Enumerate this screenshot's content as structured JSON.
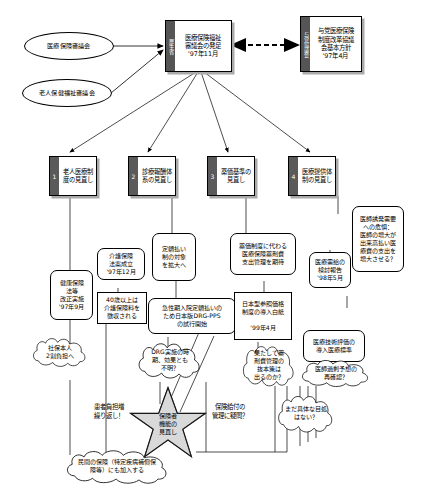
{
  "diagram": {
    "colors": {
      "ink": "#000000",
      "spine_fill": "#555555",
      "shadow": "#aaaaaa",
      "star_fill": "#d9d9d9",
      "background": "#ffffff"
    }
  },
  "inputs": [
    {
      "id": "oval-1",
      "label": "医療保険審議会"
    },
    {
      "id": "oval-2",
      "label": "老人保健福祉審議会"
    }
  ],
  "headline_boxes": [
    {
      "id": "box-council",
      "spine": "厚生省",
      "body": "医療保険福祉\n審議会の発足\n'97年11月"
    },
    {
      "id": "box-ruling-party",
      "spine": "与党協議会",
      "body": "与党医療保険\n制度改革協議\n会基本方針\n'97年4月"
    }
  ],
  "reform_items": [
    {
      "num": "1",
      "label": "老人医療制\n度の見直し"
    },
    {
      "num": "2",
      "label": "診療報酬体\n系の見直し"
    },
    {
      "num": "3",
      "label": "薬価基準の\n見直し"
    },
    {
      "num": "4",
      "label": "医療提供体\n制の見直し"
    }
  ],
  "callouts": [
    {
      "id": "c-kaigo-law",
      "shape": "rounded-rect",
      "label": "介護保険\n法案成立\n'97年12月"
    },
    {
      "id": "c-kenpo-law",
      "shape": "rounded-rect",
      "label": "健康保険\n法等\n改正実施\n'97年9月"
    },
    {
      "id": "c-age40",
      "shape": "rect",
      "label": "40歳以上は\n介護保険料を\n徴収される"
    },
    {
      "id": "c-teigaku",
      "shape": "rounded-rect",
      "label": "定額払い\n制の対象\nを拡大へ"
    },
    {
      "id": "c-yakka-kawaru",
      "shape": "rounded-rect",
      "label": "薬価制度に代わる\n医療保険薬剤費\n支出管理を期待"
    },
    {
      "id": "c-juyou-report",
      "shape": "rounded-rect",
      "label": "医療需給の\n検討報告\n'98年5月"
    },
    {
      "id": "c-induced-demand",
      "shape": "rounded-rect",
      "label": "医師誘発需要\nへの危惧：\n医師の増大が\n出来高払い医\n療費の支出を\n増大させる？"
    },
    {
      "id": "c-drg-ppso",
      "shape": "rounded-rect",
      "label": "急性期入院定額払いの\nため日本版DRG-PPS\nの試行開始"
    },
    {
      "id": "c-ref-price",
      "shape": "rect-thick",
      "label": "日本型参照価格\n制度の導入白紙\n\n'99年4月"
    },
    {
      "id": "c-tech-eval",
      "shape": "rounded-rect",
      "label": "医療技術評価の\n導入医療標準"
    },
    {
      "id": "c-doctor-excess",
      "shape": "cloud",
      "label": "医師過剰予想の\n再確認？"
    },
    {
      "id": "c-shaho",
      "shape": "cloud",
      "label": "社保本人\n2割負担へ"
    },
    {
      "id": "c-drg-unclear",
      "shape": "cloud",
      "label": "DRG実施の時\n期、効果とも\n不明？"
    },
    {
      "id": "c-drug-cost",
      "shape": "cloud",
      "label": "果たして薬\n剤費管理の\n抜本策は\n出るのか？"
    },
    {
      "id": "c-patient-burden",
      "shape": "plain-text",
      "label": "患者負担増\n繰り返し！"
    },
    {
      "id": "c-benefit-doubt",
      "shape": "plain-text",
      "label": "保険給付の\n管理に疑問？"
    },
    {
      "id": "c-no-prospect",
      "shape": "cloud",
      "label": "まだ具体な目処\nはない？"
    },
    {
      "id": "c-private-ins",
      "shape": "cloud",
      "label": "民間の保険（特定疾病補償保\n険等）にも加入する"
    }
  ],
  "star": {
    "id": "star-insurer",
    "label": "保険者\n機能の\n見直し"
  }
}
